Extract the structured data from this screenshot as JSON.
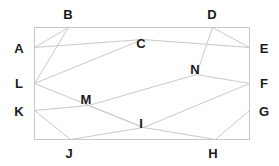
{
  "figure": {
    "type": "geometry-diagram",
    "canvas": {
      "width": 279,
      "height": 166
    },
    "colors": {
      "background": "#ffffff",
      "stroke": "#c9c9c9",
      "rectangle_stroke": "#c9c9c9",
      "label_text": "#1a1a1a"
    },
    "stroke_width": 1,
    "rectangle": {
      "x": 34,
      "y": 27,
      "width": 215,
      "height": 112
    },
    "points": {
      "A": {
        "x": 34,
        "y": 47
      },
      "B": {
        "x": 68,
        "y": 27
      },
      "C": {
        "x": 142,
        "y": 39
      },
      "D": {
        "x": 212,
        "y": 27
      },
      "E": {
        "x": 249,
        "y": 47
      },
      "F": {
        "x": 249,
        "y": 83
      },
      "G": {
        "x": 249,
        "y": 110
      },
      "H": {
        "x": 215,
        "y": 139
      },
      "I": {
        "x": 143,
        "y": 127
      },
      "J": {
        "x": 70,
        "y": 139
      },
      "K": {
        "x": 34,
        "y": 110
      },
      "L": {
        "x": 34,
        "y": 83
      },
      "M": {
        "x": 88,
        "y": 105
      },
      "N": {
        "x": 196,
        "y": 74
      }
    },
    "segments": [
      {
        "from": "A",
        "to": "C"
      },
      {
        "from": "B",
        "to": "L"
      },
      {
        "from": "C",
        "to": "E"
      },
      {
        "from": "D",
        "to": "N"
      },
      {
        "from": "N",
        "to": "F"
      },
      {
        "from": "L",
        "to": "C"
      },
      {
        "from": "L",
        "to": "I"
      },
      {
        "from": "M",
        "to": "N"
      },
      {
        "from": "I",
        "to": "F"
      },
      {
        "from": "K",
        "to": "M"
      },
      {
        "from": "M",
        "to": "I"
      },
      {
        "from": "K",
        "to": "J"
      },
      {
        "from": "J",
        "to": "I"
      },
      {
        "from": "I",
        "to": "H"
      },
      {
        "from": "H",
        "to": "G"
      },
      {
        "from": "F",
        "to": "G"
      },
      {
        "from": "A",
        "to": "B"
      },
      {
        "from": "D",
        "to": "E"
      }
    ],
    "labels": [
      {
        "id": "A",
        "text": "A",
        "x": 19,
        "y": 48
      },
      {
        "id": "B",
        "text": "B",
        "x": 68,
        "y": 14
      },
      {
        "id": "C",
        "text": "C",
        "x": 141,
        "y": 43
      },
      {
        "id": "D",
        "text": "D",
        "x": 212,
        "y": 14
      },
      {
        "id": "E",
        "text": "E",
        "x": 264,
        "y": 48
      },
      {
        "id": "F",
        "text": "F",
        "x": 264,
        "y": 83
      },
      {
        "id": "G",
        "text": "G",
        "x": 264,
        "y": 111
      },
      {
        "id": "H",
        "text": "H",
        "x": 213,
        "y": 153
      },
      {
        "id": "I",
        "text": "I",
        "x": 141,
        "y": 123
      },
      {
        "id": "J",
        "text": "J",
        "x": 69,
        "y": 153
      },
      {
        "id": "K",
        "text": "K",
        "x": 19,
        "y": 111
      },
      {
        "id": "L",
        "text": "L",
        "x": 19,
        "y": 83
      },
      {
        "id": "M",
        "text": "M",
        "x": 86,
        "y": 99
      },
      {
        "id": "N",
        "text": "N",
        "x": 195,
        "y": 69
      }
    ]
  }
}
